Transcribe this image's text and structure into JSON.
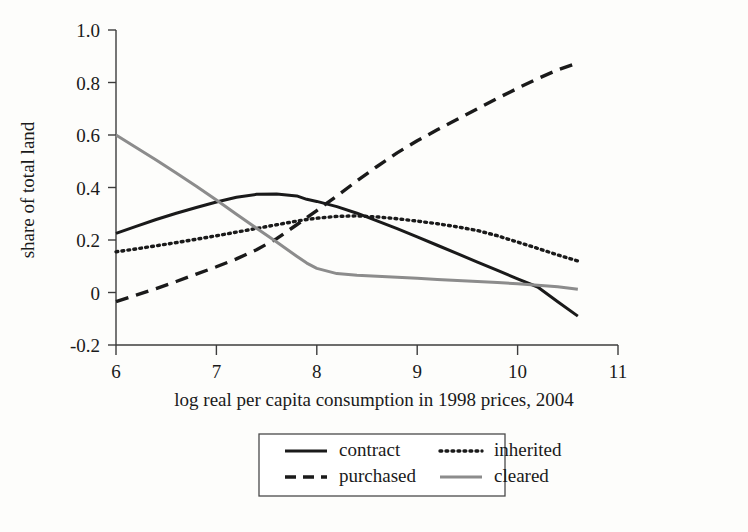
{
  "chart_data": {
    "type": "line",
    "title": "",
    "xlabel": "log real per capita consumption in 1998 prices, 2004",
    "ylabel": "share of total land",
    "xlim": [
      6,
      11
    ],
    "ylim": [
      -0.2,
      1.0
    ],
    "xticks": [
      6,
      7,
      8,
      9,
      10,
      11
    ],
    "xtick_labels": [
      "6",
      "7",
      "8",
      "9",
      "10",
      "11"
    ],
    "yticks": [
      -0.2,
      0,
      0.2,
      0.4,
      0.6,
      0.8,
      1.0
    ],
    "ytick_labels": [
      "-0.2",
      "0",
      "0.2",
      "0.4",
      "0.6",
      "0.8",
      "1.0"
    ],
    "grid": false,
    "legend_position": "below-center",
    "x": [
      6.0,
      6.2,
      6.4,
      6.6,
      6.8,
      7.0,
      7.2,
      7.4,
      7.6,
      7.8,
      7.9,
      8.0,
      8.2,
      8.4,
      8.6,
      8.8,
      9.0,
      9.2,
      9.4,
      9.6,
      9.8,
      10.0,
      10.2,
      10.4,
      10.6
    ],
    "series": [
      {
        "name": "contract",
        "style": "solid",
        "color": "#1a1a1a",
        "values": [
          0.225,
          0.252,
          0.278,
          0.302,
          0.324,
          0.345,
          0.363,
          0.374,
          0.375,
          0.368,
          0.355,
          0.347,
          0.327,
          0.302,
          0.273,
          0.243,
          0.212,
          0.18,
          0.148,
          0.116,
          0.084,
          0.052,
          0.021,
          -0.035,
          -0.09
        ]
      },
      {
        "name": "purchased",
        "style": "dashed",
        "color": "#1a1a1a",
        "values": [
          -0.035,
          -0.01,
          0.015,
          0.042,
          0.07,
          0.098,
          0.128,
          0.163,
          0.205,
          0.258,
          0.285,
          0.312,
          0.368,
          0.425,
          0.48,
          0.532,
          0.578,
          0.62,
          0.66,
          0.7,
          0.74,
          0.778,
          0.815,
          0.848,
          0.875
        ]
      },
      {
        "name": "inherited",
        "style": "dotted",
        "color": "#1a1a1a",
        "values": [
          0.155,
          0.166,
          0.178,
          0.19,
          0.203,
          0.216,
          0.23,
          0.244,
          0.258,
          0.272,
          0.278,
          0.283,
          0.29,
          0.292,
          0.288,
          0.281,
          0.272,
          0.262,
          0.25,
          0.236,
          0.216,
          0.192,
          0.168,
          0.143,
          0.12
        ]
      },
      {
        "name": "cleared",
        "style": "solid",
        "color": "#8c8c8c",
        "values": [
          0.6,
          0.552,
          0.505,
          0.455,
          0.405,
          0.352,
          0.298,
          0.245,
          0.192,
          0.138,
          0.112,
          0.092,
          0.072,
          0.066,
          0.062,
          0.058,
          0.054,
          0.05,
          0.046,
          0.042,
          0.038,
          0.033,
          0.028,
          0.022,
          0.012
        ]
      }
    ]
  },
  "legend": {
    "entries": [
      {
        "label": "contract",
        "style": "solid",
        "color": "#1a1a1a"
      },
      {
        "label": "purchased",
        "style": "dashed",
        "color": "#1a1a1a"
      },
      {
        "label": "inherited",
        "style": "dotted",
        "color": "#1a1a1a"
      },
      {
        "label": "cleared",
        "style": "solid",
        "color": "#8c8c8c"
      }
    ]
  },
  "colors": {
    "background": "#fdfdfb",
    "axis": "#3c3c3c",
    "text": "#1a1a1a",
    "accent_dark": "#1a1a1a",
    "accent_gray": "#8c8c8c"
  }
}
